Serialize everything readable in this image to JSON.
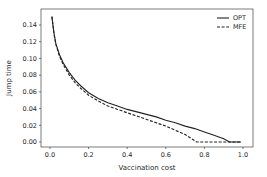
{
  "chart_data": {
    "type": "line",
    "title": "",
    "xlabel": "Vaccination cost",
    "ylabel": "Jump time",
    "xlim": [
      -0.04,
      1.05
    ],
    "ylim": [
      -0.007,
      0.158
    ],
    "xticks": [
      "0.0",
      "0.2",
      "0.4",
      "0.6",
      "0.8",
      "1.0"
    ],
    "yticks": [
      "0.00",
      "0.02",
      "0.04",
      "0.06",
      "0.08",
      "0.10",
      "0.12",
      "0.14"
    ],
    "grid": false,
    "legend_position": "upper right",
    "series": [
      {
        "name": "OPT",
        "style": "solid",
        "color": "#222222",
        "x": [
          0.01,
          0.02,
          0.03,
          0.05,
          0.07,
          0.1,
          0.13,
          0.16,
          0.2,
          0.25,
          0.3,
          0.35,
          0.4,
          0.45,
          0.5,
          0.55,
          0.6,
          0.65,
          0.7,
          0.75,
          0.8,
          0.85,
          0.9,
          0.93,
          0.96,
          0.99
        ],
        "y": [
          0.15,
          0.131,
          0.118,
          0.104,
          0.094,
          0.083,
          0.074,
          0.067,
          0.059,
          0.052,
          0.047,
          0.043,
          0.039,
          0.036,
          0.033,
          0.03,
          0.026,
          0.023,
          0.019,
          0.016,
          0.012,
          0.008,
          0.004,
          0.0,
          0.0,
          0.0
        ]
      },
      {
        "name": "MFE",
        "style": "dashed",
        "color": "#222222",
        "x": [
          0.01,
          0.02,
          0.03,
          0.05,
          0.07,
          0.1,
          0.13,
          0.16,
          0.2,
          0.25,
          0.3,
          0.35,
          0.4,
          0.45,
          0.5,
          0.55,
          0.6,
          0.65,
          0.7,
          0.76,
          0.8,
          0.85,
          0.9,
          0.95,
          0.99
        ],
        "y": [
          0.15,
          0.13,
          0.117,
          0.102,
          0.092,
          0.08,
          0.071,
          0.064,
          0.056,
          0.049,
          0.043,
          0.039,
          0.035,
          0.031,
          0.027,
          0.023,
          0.019,
          0.014,
          0.009,
          0.0,
          0.0,
          0.0,
          0.0,
          0.0,
          0.0
        ]
      }
    ]
  }
}
